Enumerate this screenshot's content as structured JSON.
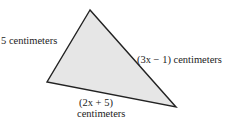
{
  "figure": {
    "shape": "triangle",
    "fill_color": "#e6e6e6",
    "stroke_color": "#222222",
    "vertices": {
      "top": [
        90,
        10
      ],
      "left": [
        47,
        82
      ],
      "right": [
        176,
        107
      ]
    },
    "sides": {
      "left": "5 centimeters",
      "right": "(3x − 1) centimeters",
      "bottom_line1": "(2x + 5)",
      "bottom_line2": "centimeters"
    }
  }
}
